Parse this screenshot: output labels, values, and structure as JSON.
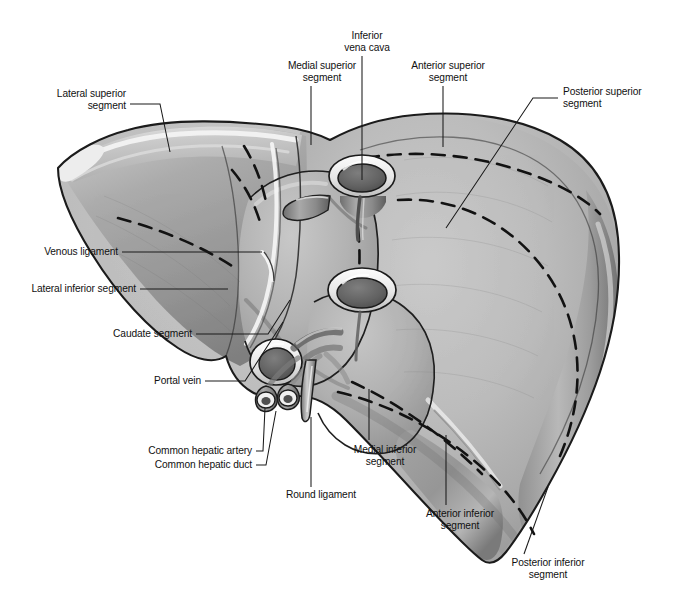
{
  "figure": {
    "render_type": "anatomical-line-illustration",
    "palette": {
      "background": "#ffffff",
      "ink": "#111111",
      "leader_line": "#1a1a1a",
      "tissue_light": "#c3c3c3",
      "tissue_mid": "#ababab",
      "tissue_dark": "#8e8e8e",
      "tissue_deep": "#6e6e6e",
      "highlight": "#f2f2f2",
      "outline": "#1c1c1c",
      "dash": "#141414",
      "vessel_rim": "#fbfbfb",
      "vessel_lumen": "#5c5c5c"
    }
  },
  "labels": [
    {
      "id": "lateral-superior-segment",
      "text": "Lateral superior\nsegment",
      "align": "r",
      "x": 22,
      "y": 88,
      "w": 104,
      "leader": [
        [
          130,
          104
        ],
        [
          160,
          104
        ],
        [
          170,
          152
        ]
      ]
    },
    {
      "id": "medial-superior-segment",
      "text": "Medial superior\nsegment",
      "align": "c",
      "x": 270,
      "y": 60,
      "w": 104,
      "leader": [
        [
          311,
          86
        ],
        [
          311,
          145
        ]
      ]
    },
    {
      "id": "inferior-vena-cava",
      "text": "Inferior\nvena cava",
      "align": "c",
      "x": 327,
      "y": 30,
      "w": 80,
      "leader": [
        [
          362,
          56
        ],
        [
          362,
          180
        ]
      ]
    },
    {
      "id": "anterior-superior-segment",
      "text": "Anterior superior\nsegment",
      "align": "c",
      "x": 392,
      "y": 60,
      "w": 112,
      "leader": [
        [
          443,
          86
        ],
        [
          443,
          147
        ]
      ]
    },
    {
      "id": "posterior-superior-segment",
      "text": "Posterior superior\nsegment",
      "align": "l",
      "x": 563,
      "y": 86,
      "w": 112,
      "leader": [
        [
          558,
          98
        ],
        [
          533,
          98
        ],
        [
          446,
          228
        ]
      ]
    },
    {
      "id": "venous-ligament",
      "text": "Venous ligament",
      "align": "r",
      "x": 22,
      "y": 246,
      "w": 96,
      "leader": [
        [
          122,
          252
        ],
        [
          262,
          252
        ]
      ]
    },
    {
      "id": "lateral-inferior-segment",
      "text": "Lateral inferior segment",
      "align": "r",
      "x": 10,
      "y": 283,
      "w": 126,
      "leader": [
        [
          140,
          289
        ],
        [
          228,
          289
        ]
      ]
    },
    {
      "id": "caudate-segment",
      "text": "Caudate segment",
      "align": "r",
      "x": 90,
      "y": 328,
      "w": 102,
      "leader": [
        [
          196,
          334
        ],
        [
          268,
          334
        ],
        [
          290,
          300
        ]
      ]
    },
    {
      "id": "portal-vein",
      "text": "Portal vein",
      "align": "r",
      "x": 133,
      "y": 375,
      "w": 68,
      "leader": [
        [
          205,
          381
        ],
        [
          245,
          381
        ],
        [
          283,
          322
        ]
      ]
    },
    {
      "id": "common-hepatic-artery",
      "text": "Common hepatic artery",
      "align": "r",
      "x": 128,
      "y": 445,
      "w": 124,
      "leader": [
        [
          256,
          451
        ],
        [
          263,
          451
        ],
        [
          265,
          408
        ]
      ]
    },
    {
      "id": "common-hepatic-duct",
      "text": "Common hepatic duct",
      "align": "r",
      "x": 136,
      "y": 459,
      "w": 116,
      "leader": [
        [
          256,
          465
        ],
        [
          266,
          465
        ],
        [
          276,
          411
        ]
      ]
    },
    {
      "id": "round-ligament",
      "text": "Round ligament",
      "align": "c",
      "x": 273,
      "y": 489,
      "w": 96,
      "leader": [
        [
          311,
          487
        ],
        [
          311,
          417
        ]
      ]
    },
    {
      "id": "medial-inferior-segment",
      "text": "Medial inferior\nsegment",
      "align": "c",
      "x": 335,
      "y": 444,
      "w": 100,
      "leader": [
        [
          369,
          440
        ],
        [
          369,
          389
        ]
      ]
    },
    {
      "id": "anterior-inferior-segment",
      "text": "Anterior inferior\nsegment",
      "align": "c",
      "x": 406,
      "y": 508,
      "w": 108,
      "leader": [
        [
          446,
          505
        ],
        [
          446,
          435
        ]
      ]
    },
    {
      "id": "posterior-inferior-segment",
      "text": "Posterior inferior\nsegment",
      "align": "c",
      "x": 492,
      "y": 557,
      "w": 112,
      "leader": [
        [
          524,
          554
        ],
        [
          548,
          487
        ]
      ]
    }
  ]
}
